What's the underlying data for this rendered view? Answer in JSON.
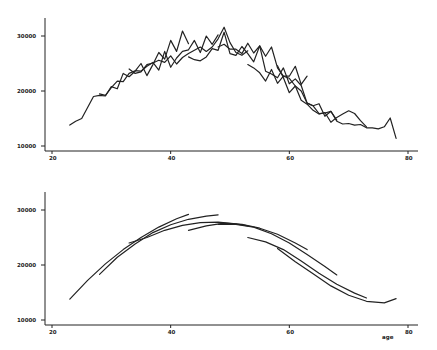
{
  "chart_data": [
    {
      "type": "line",
      "title": "",
      "xlabel": "",
      "ylabel": "",
      "xlim": [
        18,
        82
      ],
      "ylim": [
        9500,
        33000
      ],
      "xticks": [
        20,
        40,
        60,
        80
      ],
      "yticks": [
        10000,
        20000,
        30000
      ],
      "xtick_labels": [
        "20",
        "40",
        "60",
        "80"
      ],
      "ytick_labels": [
        "10000",
        "20000",
        "30000"
      ],
      "grid": false,
      "legend": null,
      "description": "Observed (jagged) income by age for overlapping cohorts",
      "series": [
        {
          "name": "cohort-1",
          "x": [
            23,
            24,
            25,
            26,
            27,
            28,
            29,
            30,
            31,
            32,
            33,
            34,
            35,
            36,
            37,
            38,
            39,
            40,
            41,
            42,
            43
          ],
          "y": [
            13800,
            14500,
            15000,
            17000,
            19000,
            19200,
            19100,
            20800,
            20400,
            23200,
            22600,
            23600,
            25000,
            22800,
            24800,
            27000,
            25800,
            29200,
            27200,
            30900,
            28600
          ]
        },
        {
          "name": "cohort-2",
          "x": [
            28,
            29,
            30,
            31,
            32,
            33,
            34,
            35,
            36,
            37,
            38,
            39,
            40,
            41,
            42,
            43,
            44,
            45,
            46,
            47,
            48
          ],
          "y": [
            19500,
            19200,
            20600,
            21800,
            21700,
            23200,
            23700,
            23600,
            24500,
            25200,
            23800,
            27200,
            24300,
            26000,
            27200,
            27500,
            29200,
            27000,
            30000,
            28500,
            30200
          ]
        },
        {
          "name": "cohort-3",
          "x": [
            33,
            34,
            35,
            36,
            37,
            38,
            39,
            40,
            41,
            42,
            43,
            44,
            45,
            46,
            47,
            48,
            49,
            50,
            51,
            52,
            53
          ],
          "y": [
            24000,
            23200,
            23500,
            24800,
            25100,
            25600,
            25200,
            26400,
            24900,
            26100,
            26800,
            27400,
            28000,
            27200,
            28000,
            29500,
            31600,
            28800,
            27000,
            26500,
            27300
          ]
        },
        {
          "name": "cohort-4",
          "x": [
            43,
            44,
            45,
            46,
            47,
            48,
            49,
            50,
            51,
            52,
            53,
            54,
            55,
            56,
            57,
            58,
            59,
            60,
            61,
            62,
            63
          ],
          "y": [
            26200,
            25700,
            25500,
            26200,
            27700,
            27400,
            30700,
            26800,
            26500,
            28100,
            26800,
            25300,
            28200,
            26300,
            28000,
            24200,
            22700,
            22700,
            24500,
            21200,
            22700
          ]
        },
        {
          "name": "cohort-5",
          "x": [
            48,
            49,
            50,
            51,
            52,
            53,
            54,
            55,
            56,
            57,
            58,
            59,
            60,
            61,
            62,
            63,
            64,
            65,
            66,
            67,
            68
          ],
          "y": [
            28000,
            28500,
            27600,
            27600,
            26800,
            28700,
            26900,
            28200,
            23600,
            23100,
            22400,
            24200,
            21300,
            22200,
            21000,
            17800,
            17300,
            17700,
            15400,
            16300,
            14700
          ]
        },
        {
          "name": "cohort-6",
          "x": [
            53,
            54,
            55,
            56,
            57,
            58,
            59,
            60,
            61,
            62,
            63,
            64,
            65,
            66,
            67,
            68,
            69,
            70,
            71,
            72,
            73
          ],
          "y": [
            24800,
            24200,
            23300,
            21800,
            23900,
            21400,
            22700,
            22300,
            20900,
            18300,
            17600,
            16500,
            15800,
            16100,
            14300,
            15200,
            15800,
            16400,
            15900,
            14600,
            13500
          ]
        },
        {
          "name": "cohort-7",
          "x": [
            58,
            59,
            60,
            61,
            62,
            63,
            64,
            65,
            66,
            67,
            68,
            69,
            70,
            71,
            72,
            73,
            74,
            75,
            76,
            77,
            78
          ],
          "y": [
            24600,
            22400,
            19700,
            20900,
            20000,
            17800,
            17300,
            15900,
            16000,
            16300,
            14500,
            14000,
            14100,
            13800,
            13900,
            13300,
            13300,
            13100,
            13500,
            15100,
            11400
          ]
        }
      ]
    },
    {
      "type": "line",
      "title": "",
      "xlabel": "age",
      "ylabel": "",
      "xlim": [
        18,
        82
      ],
      "ylim": [
        9500,
        33000
      ],
      "xticks": [
        20,
        40,
        60,
        80
      ],
      "yticks": [
        10000,
        20000,
        30000
      ],
      "xtick_labels": [
        "20",
        "40",
        "60",
        "80"
      ],
      "ytick_labels": [
        "10000",
        "20000",
        "30000"
      ],
      "grid": false,
      "legend": null,
      "description": "Smoothed fitted income-age profiles for overlapping cohorts",
      "series": [
        {
          "name": "fit-1",
          "x": [
            23,
            26,
            29,
            32,
            35,
            38,
            41,
            43
          ],
          "y": [
            13800,
            17200,
            20200,
            22800,
            25000,
            26900,
            28400,
            29200
          ]
        },
        {
          "name": "fit-2",
          "x": [
            28,
            31,
            34,
            37,
            40,
            43,
            46,
            48
          ],
          "y": [
            18300,
            21400,
            23800,
            25900,
            27300,
            28300,
            28900,
            29100
          ]
        },
        {
          "name": "fit-3",
          "x": [
            33,
            36,
            39,
            42,
            45,
            48,
            51,
            53
          ],
          "y": [
            24000,
            25000,
            26300,
            27200,
            27700,
            27800,
            27500,
            27100
          ]
        },
        {
          "name": "fit-4",
          "x": [
            43,
            46,
            49,
            52,
            55,
            58,
            61,
            63
          ],
          "y": [
            26300,
            27100,
            27600,
            27400,
            26700,
            25600,
            24000,
            22800
          ]
        },
        {
          "name": "fit-5",
          "x": [
            48,
            51,
            54,
            57,
            60,
            63,
            66,
            68
          ],
          "y": [
            27400,
            27400,
            26900,
            25700,
            24000,
            21900,
            19700,
            18200
          ]
        },
        {
          "name": "fit-6",
          "x": [
            53,
            56,
            59,
            62,
            65,
            68,
            71,
            73
          ],
          "y": [
            25000,
            24200,
            22800,
            20700,
            18500,
            16500,
            14900,
            14000
          ]
        },
        {
          "name": "fit-7",
          "x": [
            58,
            61,
            64,
            67,
            70,
            73,
            76,
            78
          ],
          "y": [
            23000,
            20600,
            18400,
            16200,
            14500,
            13400,
            13100,
            13900
          ]
        }
      ]
    }
  ]
}
